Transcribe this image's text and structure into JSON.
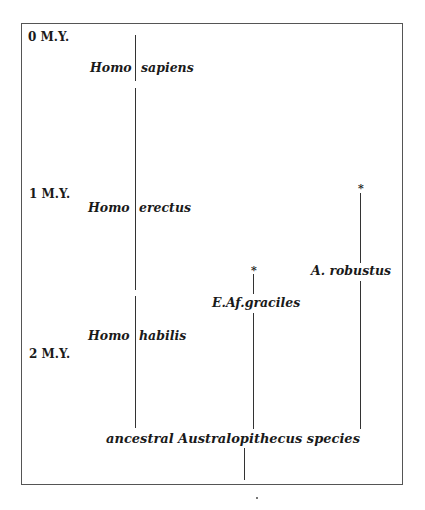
{
  "diagram": {
    "time_axis": [
      {
        "label": "0 M.Y."
      },
      {
        "label": "1 M.Y."
      },
      {
        "label": "2 M.Y."
      }
    ],
    "homo_lineage": [
      {
        "genus": "Homo",
        "species": "sapiens"
      },
      {
        "genus": "Homo",
        "species": "erectus"
      },
      {
        "genus": "Homo",
        "species": "habilis"
      }
    ],
    "australopith_branches": [
      {
        "label": "E.Af.graciles",
        "extinct_marker": "*"
      },
      {
        "label": "A.  robustus",
        "extinct_marker": "*"
      }
    ],
    "root": {
      "label": "ancestral Australopithecus species"
    }
  }
}
